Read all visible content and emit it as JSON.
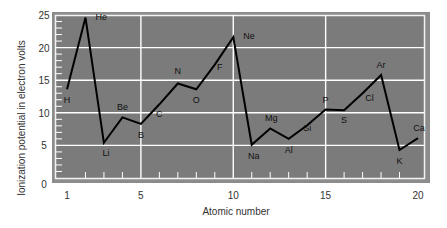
{
  "chart_data": {
    "type": "line",
    "title": "",
    "xlabel": "Atomic number",
    "ylabel": "Ionization potential in electron volts",
    "xlim": [
      1,
      20
    ],
    "ylim": [
      0,
      25
    ],
    "x_ticks": [
      "1",
      "5",
      "10",
      "15",
      "20"
    ],
    "y_ticks": [
      "0",
      "5",
      "10",
      "15",
      "20",
      "25"
    ],
    "grid": true,
    "legend": null,
    "series": [
      {
        "name": "First ionization potential",
        "x": [
          1,
          2,
          3,
          4,
          5,
          6,
          7,
          8,
          9,
          10,
          11,
          12,
          13,
          14,
          15,
          16,
          17,
          18,
          19,
          20
        ],
        "labels": [
          "H",
          "He",
          "Li",
          "Be",
          "B",
          "C",
          "N",
          "O",
          "F",
          "Ne",
          "Na",
          "Mg",
          "Al",
          "Si",
          "P",
          "S",
          "Cl",
          "Ar",
          "K",
          "Ca"
        ],
        "values": [
          13.6,
          24.6,
          5.4,
          9.3,
          8.3,
          11.3,
          14.5,
          13.6,
          17.4,
          21.6,
          5.1,
          7.6,
          6.0,
          8.1,
          10.5,
          10.4,
          13.0,
          15.8,
          4.3,
          6.1
        ]
      }
    ],
    "colors": {
      "plot_background": "#7b7b7b",
      "frame": "#8c8c8c",
      "grid": "#ffffff",
      "line": "#000000"
    }
  }
}
